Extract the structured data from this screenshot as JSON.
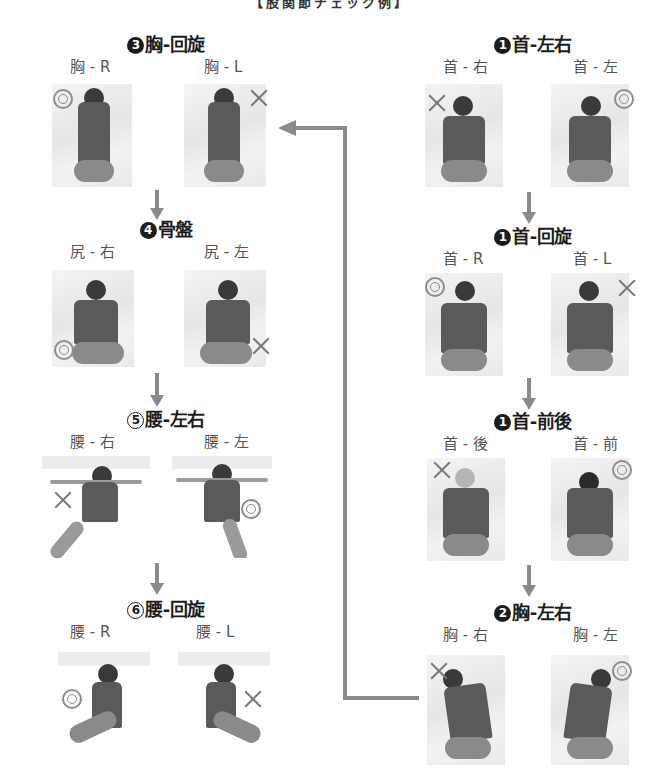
{
  "title": "【股関節チェック例】",
  "colors": {
    "heading": "#1d1d1d",
    "label": "#555555",
    "arrow": "#8a8a8a",
    "marker": "#8d8d8d"
  },
  "legend": {
    "good_marker": "◎",
    "bad_marker": "×"
  },
  "sections": {
    "neck_lr": {
      "step": "1",
      "num_style": "filled",
      "title": "首-左右",
      "left": {
        "label": "首 - 右",
        "marker": "cross"
      },
      "right": {
        "label": "首 - 左",
        "marker": "double-circle"
      }
    },
    "neck_rot": {
      "step": "1",
      "num_style": "filled",
      "title": "首-回旋",
      "left": {
        "label": "首 - R",
        "marker": "double-circle"
      },
      "right": {
        "label": "首 - L",
        "marker": "cross"
      }
    },
    "neck_fb": {
      "step": "1",
      "num_style": "filled",
      "title": "首-前後",
      "left": {
        "label": "首 - 後",
        "marker": "cross"
      },
      "right": {
        "label": "首 - 前",
        "marker": "double-circle"
      }
    },
    "chest_lr": {
      "step": "2",
      "num_style": "filled",
      "title": "胸-左右",
      "left": {
        "label": "胸 - 右",
        "marker": "cross"
      },
      "right": {
        "label": "胸 - 左",
        "marker": "double-circle"
      }
    },
    "chest_rot": {
      "step": "3",
      "num_style": "filled",
      "title": "胸-回旋",
      "left": {
        "label": "胸 - R",
        "marker": "double-circle"
      },
      "right": {
        "label": "胸 - L",
        "marker": "cross"
      }
    },
    "pelvis": {
      "step": "4",
      "num_style": "filled",
      "title": "骨盤",
      "left": {
        "label": "尻 - 右",
        "marker": "double-circle"
      },
      "right": {
        "label": "尻 - 左",
        "marker": "cross"
      }
    },
    "waist_lr": {
      "step": "5",
      "num_style": "outline",
      "title": "腰-左右",
      "left": {
        "label": "腰 - 右",
        "marker": "cross"
      },
      "right": {
        "label": "腰 - 左",
        "marker": "double-circle"
      }
    },
    "waist_rot": {
      "step": "6",
      "num_style": "outline",
      "title": "腰-回旋",
      "left": {
        "label": "腰 - R",
        "marker": "double-circle"
      },
      "right": {
        "label": "腰 - L",
        "marker": "cross"
      }
    }
  },
  "flow": [
    "neck_lr",
    "neck_rot",
    "neck_fb",
    "chest_lr",
    "chest_rot",
    "pelvis",
    "waist_lr",
    "waist_rot"
  ]
}
